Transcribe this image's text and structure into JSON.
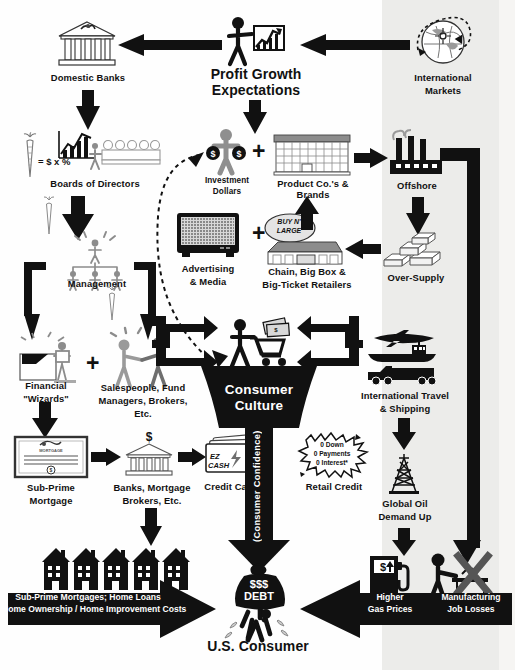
{
  "diagram": {
    "background_color": "#fefefe",
    "ink_color": "#111111",
    "panel_color": "#ececea"
  },
  "nodes": {
    "domestic_banks": {
      "label": "Domestic Banks",
      "icon": "bank-building-icon"
    },
    "profit_growth": {
      "label_line1": "Profit Growth",
      "label_line2": "Expectations",
      "icon": "person-pointing-chart-icon"
    },
    "international_markets": {
      "label_line1": "International",
      "label_line2": "Markets",
      "icon": "globe-orbit-icon"
    },
    "boards_of_directors": {
      "label": "Boards of Directors",
      "icon": "boardroom-table-icon",
      "carrot_icon": "carrot-icon",
      "equation": "= $ x %"
    },
    "management": {
      "label": "Management",
      "icon": "org-chart-people-icon",
      "carrot_icon": "carrot-icon"
    },
    "investment_dollars": {
      "label_line1": "Investment",
      "label_line2": "Dollars",
      "icon": "person-money-bags-icon"
    },
    "product_companies": {
      "label": "Product Co.'s & Brands",
      "icon": "office-building-icon"
    },
    "offshore": {
      "label": "Offshore",
      "icon": "factory-smokestacks-icon"
    },
    "over_supply": {
      "label": "Over-Supply",
      "icon": "stacked-boxes-icon"
    },
    "advertising_media": {
      "label_line1": "Advertising",
      "label_line2": "& Media",
      "icon": "television-icon"
    },
    "retailers": {
      "label_line1": "Chain, Big Box &",
      "label_line2": "Big-Ticket Retailers",
      "icon": "big-box-store-icon",
      "sign_line1": "BUY N'",
      "sign_line2": "LARGE"
    },
    "financial_wizards": {
      "label_line1": "Financial",
      "label_line2": "\"Wizards\"",
      "icon": "wizard-presenter-icon"
    },
    "salespeople": {
      "label_line1": "Salespeople, Fund",
      "label_line2": "Managers, Brokers,",
      "label_line3": "Etc.",
      "icon": "handshake-people-icon"
    },
    "subprime_mortgage": {
      "label_line1": "Sub-Prime",
      "label_line2": "Mortgage",
      "icon": "mortgage-certificate-icon"
    },
    "banks_mortgage_brokers": {
      "label_line1": "Banks, Mortgage",
      "label_line2": "Brokers, Etc.",
      "icon": "bank-dollar-icon"
    },
    "credit_cards": {
      "label": "Credit Cards",
      "icon": "credit-cards-icon",
      "card_line1": "EZ",
      "card_line2": "CASH"
    },
    "retail_credit": {
      "label": "Retail Credit",
      "icon": "starburst-icon",
      "offer_line1": "0 Down",
      "offer_line2": "0 Payments",
      "offer_line3": "0 Interest*"
    },
    "consumer_culture": {
      "label_line1": "Consumer",
      "label_line2": "Culture",
      "icon": "shopper-cart-money-icon",
      "funnel_stem_label": "(Consumer Confidence)"
    },
    "intl_travel_shipping": {
      "label_line1": "International Travel",
      "label_line2": "& Shipping",
      "icon": "plane-ship-truck-icon"
    },
    "global_oil": {
      "label_line1": "Global Oil",
      "label_line2": "Demand Up",
      "icon": "oil-derrick-icon"
    },
    "higher_gas_prices": {
      "label_line1": "Higher",
      "label_line2": "Gas Prices",
      "icon": "gas-pump-icon"
    },
    "manufacturing_job_losses": {
      "label_line1": "Manufacturing",
      "label_line2": "Job Losses",
      "icon": "worker-x-icon"
    },
    "housing_costs": {
      "label_line1": "Sub-Prime Mortgages; Home Loans",
      "label_line2": "Home Ownership / Home Improvement Costs",
      "icon": "row-of-houses-icon"
    },
    "us_consumer": {
      "label": "U.S. Consumer",
      "icon": "burdened-person-icon",
      "bag_line1": "$$$",
      "bag_line2": "DEBT"
    }
  },
  "connectors": {
    "intl_to_profit": "arrow-left",
    "profit_to_banks": "arrow-left",
    "banks_down": "arrow-down",
    "profit_down": "arrow-down",
    "boards_down": "arrow-down",
    "management_split": "bracket-split-down",
    "investment_to_products": "plus",
    "products_to_offshore": "arrow-right",
    "offshore_down": "arrow-down",
    "oversupply_to_retailers": "arrow-left",
    "retailers_up": "arrow-up",
    "advertising_plus": "plus",
    "salespeople_dashed_to_investment": "dashed-curve-arrow",
    "into_culture_left": "arrow-right",
    "into_culture_right": "arrow-left",
    "culture_stem_down": "arrow-down",
    "offshore_right_elbow": "elbow-down",
    "housing_to_consumer": "big-arrow-right",
    "costs_to_consumer": "big-arrow-left"
  }
}
